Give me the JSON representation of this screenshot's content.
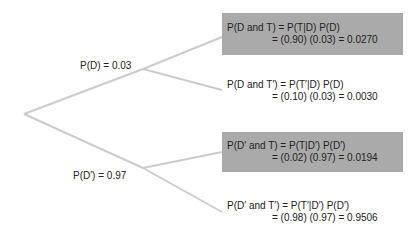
{
  "branches": {
    "d": {
      "label": "P(D) = 0.03"
    },
    "d_prime": {
      "label": "P(D′) = 0.97"
    }
  },
  "outcomes": [
    {
      "line1": "P(D and T) = P(T|D) P(D)",
      "line2": "= (0.90) (0.03) = 0.0270",
      "highlighted": true
    },
    {
      "line1": "P(D and T′) = P(T′|D) P(D)",
      "line2": "= (0.10) (0.03) = 0.0030",
      "highlighted": false
    },
    {
      "line1": "P(D′ and T) = P(T|D′) P(D′)",
      "line2": "= (0.02) (0.97) = 0.0194",
      "highlighted": true
    },
    {
      "line1": "P(D′ and T′) = P(T′|D′) P(D′)",
      "line2": "= (0.98) (0.97) = 0.9506",
      "highlighted": false
    }
  ],
  "colors": {
    "box": "#aaaaaa",
    "line": "#cccccc"
  }
}
